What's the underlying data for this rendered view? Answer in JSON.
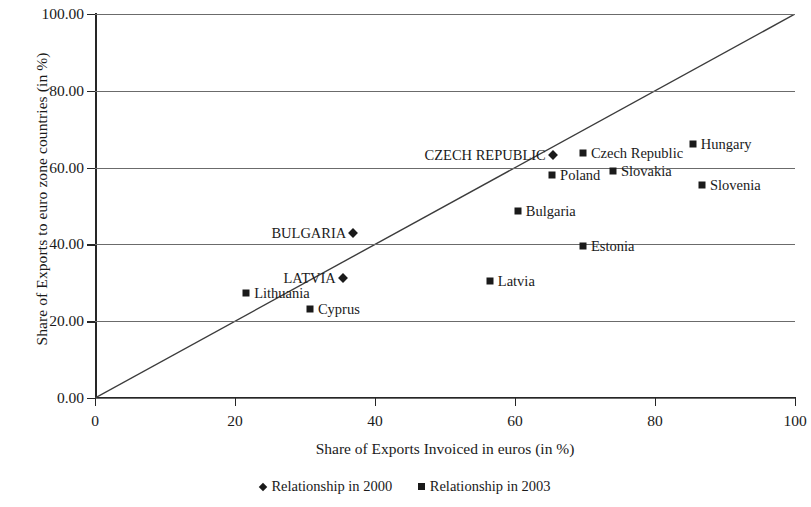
{
  "chart_data": {
    "type": "scatter",
    "title": "",
    "xlabel": "Share of Exports Invoiced in euros (in %)",
    "ylabel": "Share of Exports to euro zone countries (in %)",
    "xlim": [
      0,
      100
    ],
    "ylim": [
      0,
      100
    ],
    "xticks": [
      "0",
      "20",
      "40",
      "60",
      "80",
      "100"
    ],
    "xtick_values": [
      0,
      20,
      40,
      60,
      80,
      100
    ],
    "yticks": [
      "0.00",
      "20.00",
      "40.00",
      "60.00",
      "80.00",
      "100.00"
    ],
    "ytick_values": [
      0,
      20,
      40,
      60,
      80,
      100
    ],
    "grid": "horizontal",
    "legend_position": "bottom-center",
    "reference_line": {
      "name": "45-degree-line",
      "from": [
        0,
        0
      ],
      "to": [
        100,
        100
      ]
    },
    "series": [
      {
        "name": "Relationship in 2000",
        "marker": "diamond",
        "color": "#1a1a1a",
        "points": [
          {
            "label": "CZECH REPUBLIC",
            "x": 65.4,
            "y": 63.3,
            "label_side": "left"
          },
          {
            "label": "BULGARIA",
            "x": 36.9,
            "y": 43.0,
            "label_side": "left"
          },
          {
            "label": "LATVIA",
            "x": 35.4,
            "y": 31.3,
            "label_side": "left"
          }
        ]
      },
      {
        "name": "Relationship in 2003",
        "marker": "square",
        "color": "#1a1a1a",
        "points": [
          {
            "label": "Hungary",
            "x": 85.4,
            "y": 66.1,
            "label_side": "right"
          },
          {
            "label": "Czech Republic",
            "x": 69.7,
            "y": 63.8,
            "label_side": "right"
          },
          {
            "label": "Slovakia",
            "x": 74.0,
            "y": 59.1,
            "label_side": "right"
          },
          {
            "label": "Poland",
            "x": 65.3,
            "y": 58.1,
            "label_side": "right"
          },
          {
            "label": "Slovenia",
            "x": 86.7,
            "y": 55.5,
            "label_side": "right"
          },
          {
            "label": "Bulgaria",
            "x": 60.4,
            "y": 48.7,
            "label_side": "right"
          },
          {
            "label": "Estonia",
            "x": 69.7,
            "y": 39.6,
            "label_side": "right"
          },
          {
            "label": "Latvia",
            "x": 56.4,
            "y": 30.5,
            "label_side": "right"
          },
          {
            "label": "Lithuania",
            "x": 21.6,
            "y": 27.3,
            "label_side": "right"
          },
          {
            "label": "Cyprus",
            "x": 30.7,
            "y": 23.2,
            "label_side": "right"
          }
        ]
      }
    ],
    "legend": [
      {
        "label": "Relationship in 2000",
        "marker": "diamond"
      },
      {
        "label": "Relationship in 2003",
        "marker": "square"
      }
    ]
  }
}
